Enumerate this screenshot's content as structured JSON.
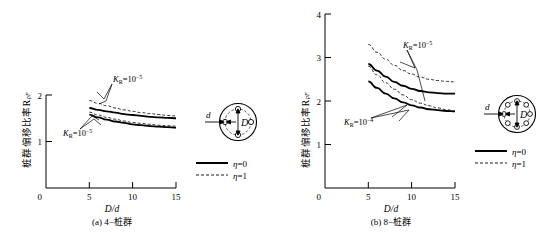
{
  "figure": {
    "panels": [
      {
        "id": "a",
        "caption": "(a) 4−桩群",
        "ylabel": "桩群偏移比率R",
        "ylabel_sub": "pF",
        "xlabel_num": "D",
        "xlabel_den": "d",
        "x_ticks": [
          "0",
          "5",
          "10",
          "15"
        ],
        "y_ticks": [
          "0",
          "1",
          "2"
        ],
        "annotations": [
          {
            "name": "kr-upper",
            "base": "K",
            "sub": "R",
            "eq": "=10",
            "exp": "−5"
          },
          {
            "name": "kr-lower",
            "base": "K",
            "sub": "R",
            "eq": "=10",
            "exp": "−5"
          }
        ],
        "legend": [
          {
            "style": "solid",
            "symbol": "η",
            "value": "=0"
          },
          {
            "style": "dashed",
            "symbol": "η",
            "value": "=1"
          }
        ],
        "diagram": {
          "name": "pile-group-4",
          "piles": 4,
          "d_label": "d",
          "D_label": "D"
        }
      },
      {
        "id": "b",
        "caption": "(b) 8−桩群",
        "ylabel": "桩群偏移比率R",
        "ylabel_sub": "pF",
        "xlabel_num": "D",
        "xlabel_den": "d",
        "x_ticks": [
          "0",
          "5",
          "10",
          "15"
        ],
        "y_ticks": [
          "0",
          "1",
          "2",
          "3",
          "4"
        ],
        "annotations": [
          {
            "name": "kr-upper",
            "base": "K",
            "sub": "R",
            "eq": "=10",
            "exp": "−5"
          },
          {
            "name": "kr-lower",
            "base": "K",
            "sub": "R",
            "eq": "=10",
            "exp": "−4"
          }
        ],
        "legend": [
          {
            "style": "solid",
            "symbol": "η",
            "value": "=0"
          },
          {
            "style": "dashed",
            "symbol": "η",
            "value": "=1"
          }
        ],
        "diagram": {
          "name": "pile-group-8",
          "piles": 8,
          "d_label": "d",
          "D_label": "D"
        }
      }
    ]
  },
  "chart_data": [
    {
      "type": "line",
      "title": "(a) 4−桩群",
      "xlabel": "D/d",
      "ylabel": "桩群偏移比率R_pF",
      "xlim": [
        0,
        15
      ],
      "ylim": [
        0,
        2
      ],
      "xticks": [
        0,
        5,
        10,
        15
      ],
      "yticks": [
        0,
        1,
        2
      ],
      "grid": false,
      "legend_position": "right",
      "x": [
        5,
        6,
        7,
        8,
        9,
        10,
        11,
        12,
        13,
        14,
        15
      ],
      "series": [
        {
          "name": "K_R=10^-5, η=1",
          "style": "dashed",
          "values": [
            1.88,
            1.82,
            1.77,
            1.72,
            1.68,
            1.65,
            1.62,
            1.6,
            1.58,
            1.56,
            1.55
          ]
        },
        {
          "name": "K_R=10^-5, η=0",
          "style": "solid",
          "values": [
            1.72,
            1.68,
            1.65,
            1.62,
            1.59,
            1.57,
            1.55,
            1.53,
            1.52,
            1.51,
            1.5
          ]
        },
        {
          "name": "K_R=10^-5 lower, η=1",
          "style": "dashed",
          "values": [
            1.63,
            1.57,
            1.52,
            1.48,
            1.44,
            1.41,
            1.39,
            1.37,
            1.35,
            1.34,
            1.33
          ]
        },
        {
          "name": "K_R=10^-5 lower, η=0",
          "style": "solid",
          "values": [
            1.58,
            1.52,
            1.47,
            1.43,
            1.4,
            1.37,
            1.35,
            1.33,
            1.32,
            1.31,
            1.3
          ]
        }
      ]
    },
    {
      "type": "line",
      "title": "(b) 8−桩群",
      "xlabel": "D/d",
      "ylabel": "桩群偏移比率R_pF",
      "xlim": [
        0,
        15
      ],
      "ylim": [
        0,
        4
      ],
      "xticks": [
        0,
        5,
        10,
        15
      ],
      "yticks": [
        0,
        1,
        2,
        3,
        4
      ],
      "grid": false,
      "legend_position": "right",
      "x": [
        5,
        6,
        7,
        8,
        9,
        10,
        11,
        12,
        13,
        14,
        15
      ],
      "series": [
        {
          "name": "K_R=10^-5, η=1",
          "style": "dashed",
          "values": [
            3.3,
            3.12,
            2.96,
            2.82,
            2.7,
            2.62,
            2.55,
            2.5,
            2.47,
            2.45,
            2.44
          ]
        },
        {
          "name": "K_R=10^-5, η=0",
          "style": "solid",
          "values": [
            2.85,
            2.7,
            2.56,
            2.44,
            2.35,
            2.28,
            2.23,
            2.2,
            2.18,
            2.17,
            2.17
          ]
        },
        {
          "name": "K_R=10^-4, η=1",
          "style": "dashed",
          "values": [
            2.8,
            2.6,
            2.42,
            2.27,
            2.14,
            2.03,
            1.95,
            1.89,
            1.84,
            1.8,
            1.77
          ]
        },
        {
          "name": "K_R=10^-4, η=0",
          "style": "solid",
          "values": [
            2.45,
            2.3,
            2.17,
            2.06,
            1.97,
            1.9,
            1.85,
            1.81,
            1.79,
            1.77,
            1.76
          ]
        }
      ]
    }
  ]
}
